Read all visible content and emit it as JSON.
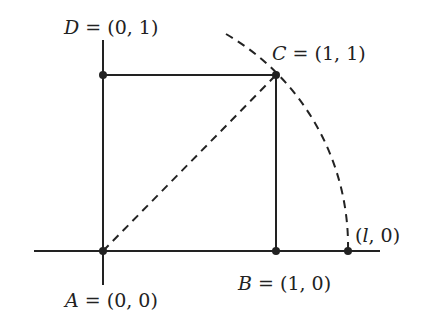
{
  "diagram": {
    "type": "geometry",
    "stroke_color": "#222222",
    "points": [
      {
        "id": "A",
        "name": "A",
        "coords": "(0, 0)",
        "label": "A = (0, 0)",
        "px": [
          103,
          251
        ]
      },
      {
        "id": "B",
        "name": "B",
        "coords": "(1, 0)",
        "label": "B = (1, 0)",
        "px": [
          276,
          251
        ]
      },
      {
        "id": "C",
        "name": "C",
        "coords": "(1, 1)",
        "label": "C = (1, 1)",
        "px": [
          276,
          75
        ]
      },
      {
        "id": "D",
        "name": "D",
        "coords": "(0, 1)",
        "label": "D = (0, 1)",
        "px": [
          103,
          75
        ]
      },
      {
        "id": "L",
        "name": "",
        "coords": "(l, 0)",
        "label": "(l, 0)",
        "px": [
          348,
          251
        ]
      }
    ],
    "labels": {
      "A": {
        "name": "A",
        "eq": " = ",
        "coords": "(0, 0)"
      },
      "B": {
        "name": "B",
        "eq": " = ",
        "coords": "(1, 0)"
      },
      "C": {
        "name": "C",
        "eq": " = ",
        "coords": "(1, 1)"
      },
      "D": {
        "name": "D",
        "eq": " = ",
        "coords": "(0, 1)"
      },
      "L": {
        "open": "(",
        "var": "l",
        "rest": ", 0)"
      }
    },
    "segments": [
      {
        "from": "D",
        "to": "C",
        "style": "solid"
      },
      {
        "from": "C",
        "to": "B",
        "style": "solid"
      },
      {
        "from": "A",
        "to": "C",
        "style": "dashed"
      }
    ],
    "axes": {
      "x_axis": "solid horizontal line through A and B",
      "y_axis": "solid vertical line through A and D"
    },
    "arc": {
      "center": "A",
      "through": [
        "C",
        "(l, 0)"
      ],
      "style": "dashed"
    }
  }
}
